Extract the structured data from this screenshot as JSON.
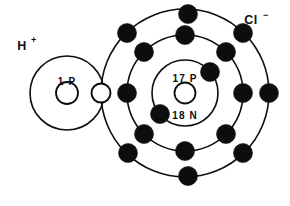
{
  "figure": {
    "background_color": "#ffffff",
    "ink_color": "#0d0d0d",
    "width": 290,
    "height": 206
  },
  "hydrogen": {
    "symbol": "H",
    "charge": "+",
    "label_x": 22,
    "label_y": 50,
    "nucleus_text": "1 P",
    "nucleus_text_x": 67,
    "nucleus_text_y": 85,
    "center_x": 67,
    "center_y": 93,
    "shell_radius": 37,
    "nucleus_radius": 11
  },
  "chlorine": {
    "symbol": "Cl",
    "charge": "−",
    "label_x": 248,
    "label_y": 24,
    "proton_text": "17 P",
    "proton_text_x": 185,
    "proton_text_y": 82,
    "neutron_text": "18 N",
    "neutron_text_x": 185,
    "neutron_text_y": 117,
    "center_x": 185,
    "center_y": 93,
    "nucleus_radius": 10.5,
    "shells": [
      {
        "name": "inner-shell",
        "radius": 33,
        "electron_count": 2
      },
      {
        "name": "middle-shell",
        "radius": 58,
        "electron_count": 8
      },
      {
        "name": "outer-shell",
        "radius": 84,
        "electron_count": 8
      }
    ]
  },
  "electrons": {
    "dot_radius": 9.5,
    "shared_dot_radius": 9.5,
    "inner_shell": [
      {
        "x": 210,
        "y": 72
      },
      {
        "x": 160,
        "y": 114
      }
    ],
    "middle_shell": [
      {
        "x": 185,
        "y": 35
      },
      {
        "x": 226,
        "y": 52
      },
      {
        "x": 243,
        "y": 93
      },
      {
        "x": 226,
        "y": 134
      },
      {
        "x": 185,
        "y": 151
      },
      {
        "x": 144,
        "y": 134
      },
      {
        "x": 127,
        "y": 93
      },
      {
        "x": 144,
        "y": 52
      }
    ],
    "outer_shell": [
      {
        "x": 188,
        "y": 14,
        "shared": false
      },
      {
        "x": 243,
        "y": 33,
        "shared": false
      },
      {
        "x": 269,
        "y": 93,
        "shared": false
      },
      {
        "x": 243,
        "y": 153,
        "shared": false
      },
      {
        "x": 188,
        "y": 176,
        "shared": false
      },
      {
        "x": 128,
        "y": 153,
        "shared": false
      },
      {
        "x": 127,
        "y": 33,
        "shared": false
      },
      {
        "x": 101,
        "y": 93,
        "shared": true
      }
    ]
  },
  "legend": {
    "shared_electron_name": "shared-electron-pair",
    "bond_description": "H⁺ and Cl⁻ joined at shared electron"
  }
}
